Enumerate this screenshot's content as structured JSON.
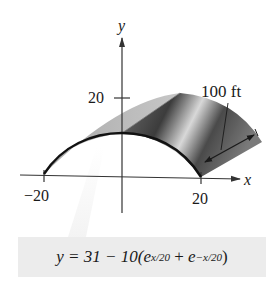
{
  "axes": {
    "x_label": "x",
    "y_label": "y",
    "x_ticks": [
      {
        "value": -20,
        "label": "−20"
      },
      {
        "value": 20,
        "label": "20"
      }
    ],
    "y_ticks": [
      {
        "value": 20,
        "label": "20"
      }
    ]
  },
  "annotation": {
    "length_label": "100 ft"
  },
  "formula": {
    "lhs": "y = 31 − 10(",
    "e1": "e",
    "exp1": "x/20",
    "plus": " + ",
    "e2": "e",
    "exp2": "−x/20",
    "close": ")"
  },
  "colors": {
    "curve": "#111111",
    "surface_dark": "#3a3a3a",
    "surface_mid": "#8a8a8a",
    "surface_light": "#cfcfcf",
    "formula_bg": "#ececec"
  }
}
